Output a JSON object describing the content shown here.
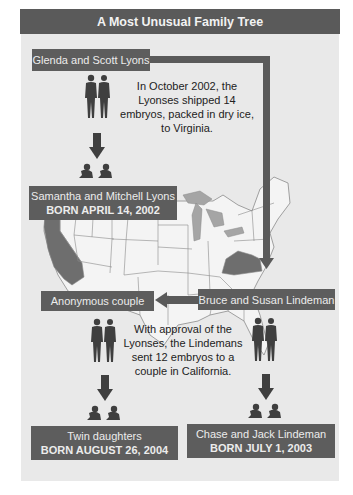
{
  "title": "A Most Unusual Family Tree",
  "colors": {
    "panel_bg": "#e9e9e9",
    "label_bg": "#5d5d5d",
    "label_text": "#ececec",
    "highlight_state": "#6e6e6e",
    "map_lines": "#8a8a8a",
    "great_lakes": "#a5a5a5"
  },
  "nodes": {
    "lyons_parents": {
      "name": "Glenda and Scott Lyons"
    },
    "lyons_children": {
      "name": "Samantha and Mitchell Lyons",
      "born": "BORN APRIL 14, 2002"
    },
    "lindeman_parents": {
      "name": "Bruce and Susan Lindeman"
    },
    "anonymous_parents": {
      "name": "Anonymous couple"
    },
    "anonymous_children": {
      "name": "Twin daughters",
      "born": "BORN AUGUST 26, 2004"
    },
    "lindeman_children": {
      "name": "Chase and Jack Lindeman",
      "born": "BORN JULY 1, 2003"
    }
  },
  "notes": {
    "shipment_1": "In October 2002, the Lyonses shipped 14 embryos, packed in dry ice, to Virginia.",
    "shipment_2": "With approval of the Lyonses, the Lindemans sent 12 embryos to a couple in California."
  },
  "map": {
    "highlighted_states": [
      "California",
      "Virginia"
    ],
    "icons": [
      "couple-silhouette-icon",
      "twin-babies-icon",
      "down-arrow-icon",
      "left-arrow-icon"
    ]
  }
}
